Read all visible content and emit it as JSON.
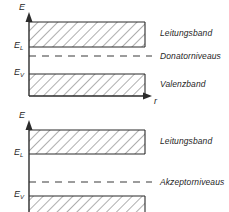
{
  "figure": {
    "type": "band-diagram-pair"
  },
  "diagrams": [
    {
      "id": "n-type",
      "y_axis_label": "E",
      "x_axis_label": "r",
      "levels": [
        {
          "name": "conduction-band-edge",
          "symbol": "E",
          "subscript": "L"
        },
        {
          "name": "valence-band-edge",
          "symbol": "E",
          "subscript": "V"
        }
      ],
      "bands": [
        {
          "name": "conduction-band",
          "label": "Leitungsband",
          "hatched": true
        },
        {
          "name": "valence-band",
          "label": "Valenzband",
          "hatched": true
        }
      ],
      "dopant": {
        "name": "donor-level",
        "label": "Donatorniveaus",
        "style": "dashed"
      }
    },
    {
      "id": "p-type",
      "y_axis_label": "E",
      "x_axis_label": "",
      "levels": [
        {
          "name": "conduction-band-edge",
          "symbol": "E",
          "subscript": "L"
        },
        {
          "name": "valence-band-edge",
          "symbol": "E",
          "subscript": "V"
        }
      ],
      "bands": [
        {
          "name": "conduction-band",
          "label": "Leitungsband",
          "hatched": true
        },
        {
          "name": "valence-band",
          "label": "",
          "hatched": true
        }
      ],
      "dopant": {
        "name": "acceptor-level",
        "label": "Akzeptorniveaus",
        "style": "dashed"
      }
    }
  ],
  "colors": {
    "ink": "#2b2b2b",
    "hatch": "#6b6b6b",
    "background": "#ffffff"
  }
}
